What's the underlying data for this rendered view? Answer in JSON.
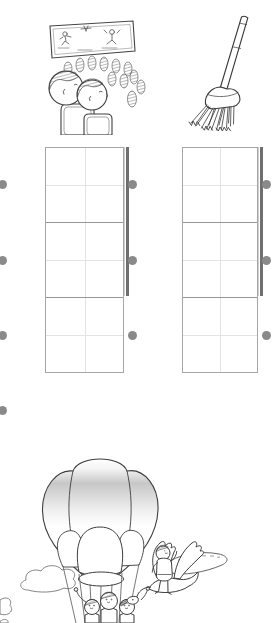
{
  "page": {
    "background": "#ffffff",
    "ink_color": "#3d3d3d",
    "visible_text": ""
  },
  "top_row": {
    "left_illustration": "children watching a movie screen in a theater",
    "right_illustration": "broom"
  },
  "matching_exercise": {
    "colors": {
      "dot": "#8a8a8a",
      "bar": "#6f6f6f",
      "grid_border": "#a6a6a6",
      "row_border": "#979797",
      "guide": "#e3e3e3"
    },
    "left_edge_dots": 4,
    "writing_grids": [
      {
        "position": "left",
        "rows": 3,
        "columns": 1,
        "right_dots": 3,
        "cells_empty": true
      },
      {
        "position": "right",
        "rows": 3,
        "columns": 1,
        "right_dots": 3,
        "cells_empty": true
      }
    ]
  },
  "bottom_illustration": "hot air balloon with children in basket, child riding a flying goose, clouds and island"
}
